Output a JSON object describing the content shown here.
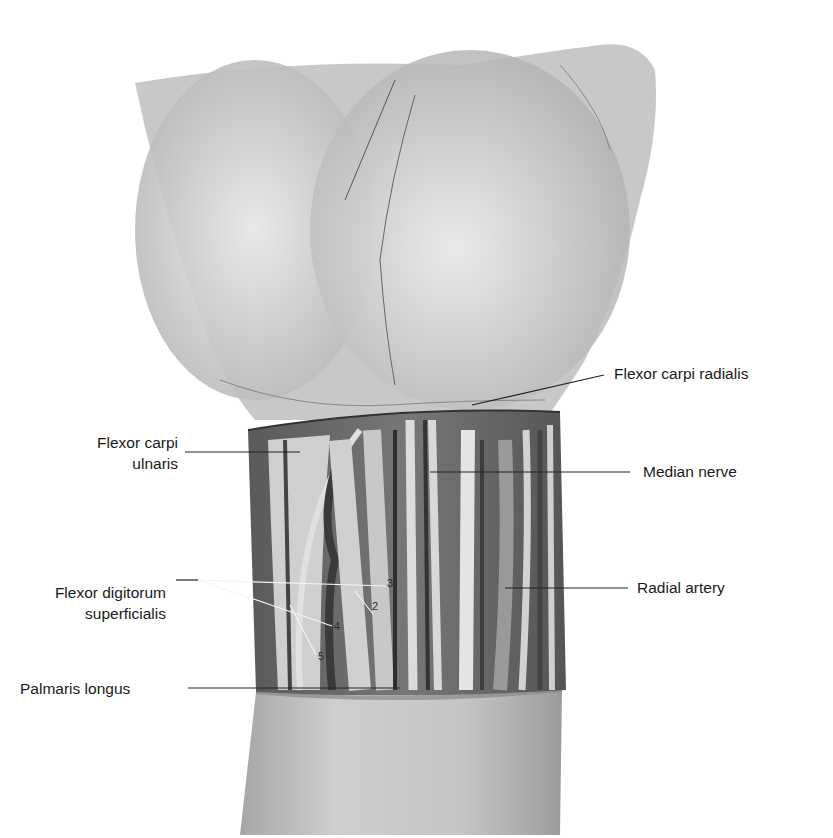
{
  "figure": {
    "labels": {
      "flexor_carpi_radialis": "Flexor carpi radialis",
      "flexor_carpi_ulnaris_line1": "Flexor carpi",
      "flexor_carpi_ulnaris_line2": "ulnaris",
      "median_nerve": "Median nerve",
      "flexor_digitorum_line1": "Flexor digitorum",
      "flexor_digitorum_line2": "superficialis",
      "radial_artery": "Radial artery",
      "palmaris_longus": "Palmaris longus"
    },
    "tendon_numbers": [
      "2",
      "3",
      "4",
      "5"
    ],
    "colors": {
      "background": "#ffffff",
      "skin_light": "#e2e2e2",
      "skin_mid": "#b8b8b8",
      "tissue_dark": "#3a3a3a",
      "tendon": "#d6d6d6",
      "leader_line": "#222222",
      "label_text": "#1a1a1a"
    }
  }
}
